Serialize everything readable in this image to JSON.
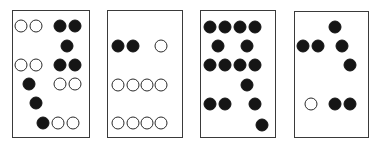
{
  "colors": {
    "filled": "#151515",
    "open_border": "#2a2a2a",
    "frame": "#3a3a3a",
    "background": "#ffffff"
  },
  "panels": [
    {
      "id": 1,
      "box": {
        "x": 12,
        "y": 10,
        "w": 78,
        "h": 128
      },
      "dots": [
        {
          "x": 21,
          "y": 26,
          "type": "open"
        },
        {
          "x": 36,
          "y": 26,
          "type": "open"
        },
        {
          "x": 60,
          "y": 26,
          "type": "filled"
        },
        {
          "x": 75,
          "y": 26,
          "type": "filled"
        },
        {
          "x": 67,
          "y": 46,
          "type": "filled"
        },
        {
          "x": 21,
          "y": 65,
          "type": "open"
        },
        {
          "x": 36,
          "y": 65,
          "type": "open"
        },
        {
          "x": 60,
          "y": 65,
          "type": "filled"
        },
        {
          "x": 75,
          "y": 65,
          "type": "filled"
        },
        {
          "x": 29,
          "y": 84,
          "type": "filled"
        },
        {
          "x": 60,
          "y": 84,
          "type": "open"
        },
        {
          "x": 75,
          "y": 84,
          "type": "open"
        },
        {
          "x": 36,
          "y": 103,
          "type": "filled"
        },
        {
          "x": 43,
          "y": 123,
          "type": "filled"
        },
        {
          "x": 58,
          "y": 123,
          "type": "open"
        },
        {
          "x": 73,
          "y": 123,
          "type": "open"
        }
      ]
    },
    {
      "id": 2,
      "box": {
        "x": 107,
        "y": 10,
        "w": 76,
        "h": 128
      },
      "dots": [
        {
          "x": 118,
          "y": 46,
          "type": "filled"
        },
        {
          "x": 133,
          "y": 46,
          "type": "filled"
        },
        {
          "x": 161,
          "y": 46,
          "type": "open"
        },
        {
          "x": 118,
          "y": 85,
          "type": "open"
        },
        {
          "x": 133,
          "y": 85,
          "type": "open"
        },
        {
          "x": 147,
          "y": 85,
          "type": "open"
        },
        {
          "x": 161,
          "y": 85,
          "type": "open"
        },
        {
          "x": 118,
          "y": 123,
          "type": "open"
        },
        {
          "x": 133,
          "y": 123,
          "type": "open"
        },
        {
          "x": 147,
          "y": 123,
          "type": "open"
        },
        {
          "x": 161,
          "y": 123,
          "type": "open"
        }
      ]
    },
    {
      "id": 3,
      "box": {
        "x": 200,
        "y": 10,
        "w": 76,
        "h": 128
      },
      "dots": [
        {
          "x": 210,
          "y": 27,
          "type": "filled"
        },
        {
          "x": 225,
          "y": 27,
          "type": "filled"
        },
        {
          "x": 240,
          "y": 27,
          "type": "filled"
        },
        {
          "x": 255,
          "y": 27,
          "type": "filled"
        },
        {
          "x": 218,
          "y": 46,
          "type": "filled"
        },
        {
          "x": 247,
          "y": 46,
          "type": "filled"
        },
        {
          "x": 210,
          "y": 65,
          "type": "filled"
        },
        {
          "x": 225,
          "y": 65,
          "type": "filled"
        },
        {
          "x": 240,
          "y": 65,
          "type": "filled"
        },
        {
          "x": 255,
          "y": 65,
          "type": "filled"
        },
        {
          "x": 247,
          "y": 85,
          "type": "filled"
        },
        {
          "x": 210,
          "y": 104,
          "type": "filled"
        },
        {
          "x": 225,
          "y": 104,
          "type": "filled"
        },
        {
          "x": 255,
          "y": 104,
          "type": "filled"
        },
        {
          "x": 262,
          "y": 125,
          "type": "filled"
        }
      ]
    },
    {
      "id": 4,
      "box": {
        "x": 294,
        "y": 11,
        "w": 75,
        "h": 127
      },
      "dots": [
        {
          "x": 335,
          "y": 27,
          "type": "filled"
        },
        {
          "x": 303,
          "y": 46,
          "type": "filled"
        },
        {
          "x": 318,
          "y": 46,
          "type": "filled"
        },
        {
          "x": 342,
          "y": 46,
          "type": "filled"
        },
        {
          "x": 350,
          "y": 65,
          "type": "filled"
        },
        {
          "x": 311,
          "y": 104,
          "type": "open"
        },
        {
          "x": 335,
          "y": 104,
          "type": "filled"
        },
        {
          "x": 350,
          "y": 104,
          "type": "filled"
        }
      ]
    }
  ]
}
